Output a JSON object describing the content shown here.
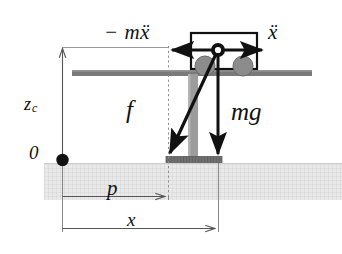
{
  "figure": {
    "width": 342,
    "height": 254,
    "background": "#ffffff"
  },
  "colors": {
    "ink": "#111111",
    "rail": "#7a7a7a",
    "leg": "#9a9a9a",
    "foot": "#6f6f6f",
    "wheel": "#8c8c8c",
    "ground_fill": "#e8e8e8",
    "ground_hatch": "#d2d2d2",
    "dimension_line": "#555555",
    "dashed_guide": "#8e8e8e"
  },
  "labels": {
    "inertial_force": "− mẍ",
    "acceleration": "ẍ",
    "reaction_force": "f",
    "gravity_force": "mg",
    "com_height": "z",
    "com_height_subscript": "c",
    "origin": "0",
    "zmp_distance": "p",
    "com_distance": "x"
  },
  "elements": {
    "cart_body": "cart-rectangle",
    "wheels": [
      "wheel-left",
      "wheel-right"
    ],
    "pivot": "center-of-mass-dot",
    "origin_marker": "origin-dot",
    "rail": "horizontal-rail",
    "leg": "vertical-leg",
    "foot": "support-foot",
    "ground": "ground-band",
    "guide": "dashed-vertical-guide",
    "axis": "vertical-z-axis"
  },
  "geometry": {
    "z_axis_x": 62,
    "z_axis_top": 47,
    "origin_y": 160,
    "rail_y": 73,
    "pivot_x": 218,
    "pivot_y": 50,
    "foot_left": 166,
    "foot_right": 222,
    "foot_y": 160,
    "guide_x": 168,
    "ground_top": 163,
    "ground_bottom": 200,
    "dim_p_y": 196,
    "dim_x_y": 228
  }
}
